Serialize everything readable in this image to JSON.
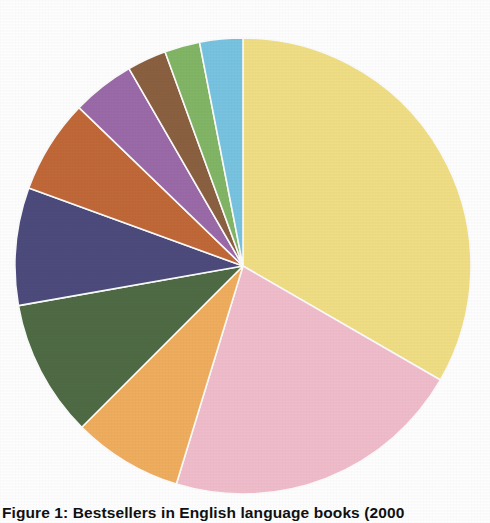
{
  "figure": {
    "caption": "Figure 1: Bestsellers in English language books (2000",
    "background_color": "#fefefe"
  },
  "chart_data": {
    "type": "pie",
    "title": "Figure 1: Bestsellers in English language books (2000",
    "center_x": 243,
    "center_y": 266,
    "radius": 228,
    "start_angle_deg": 0,
    "direction": "clockwise",
    "grid": false,
    "legend": "none",
    "labels": [
      "Segment 1",
      "Segment 2",
      "Segment 3",
      "Segment 4",
      "Segment 5",
      "Segment 6",
      "Segment 7",
      "Segment 8",
      "Segment 9",
      "Segment 10"
    ],
    "values": [
      120,
      77,
      28,
      35,
      30,
      24,
      16,
      10,
      9,
      11
    ],
    "percentages": [
      33.3,
      21.4,
      7.8,
      9.7,
      8.3,
      6.7,
      4.4,
      2.8,
      2.5,
      3.1
    ],
    "colors": [
      "#f0de85",
      "#f0bccb",
      "#efad5e",
      "#4f6b45",
      "#4c4b7c",
      "#c06838",
      "#9b6aa8",
      "#8a6040",
      "#82b566",
      "#78c3e0"
    ],
    "color_names": [
      "yellow",
      "pink",
      "light-orange",
      "dark-green",
      "slate-navy",
      "rust-orange",
      "mauve-purple",
      "brown",
      "green",
      "light-blue"
    ],
    "slice_stroke_color": "#fbfbfb"
  }
}
